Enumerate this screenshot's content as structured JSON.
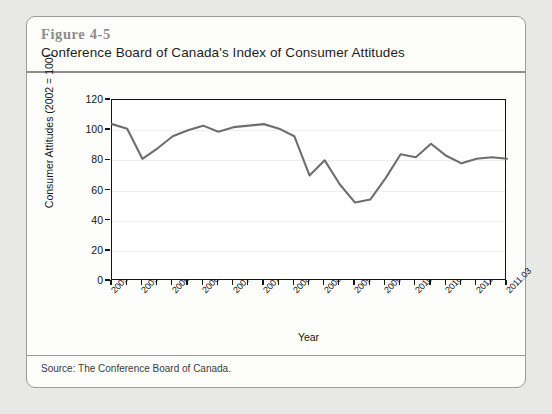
{
  "figure": {
    "number": "Figure 4-5",
    "title": "Conference Board of Canada's Index of Consumer Attitudes",
    "source": "Source: The Conference Board of Canada."
  },
  "chart_data": {
    "type": "line",
    "title": "Conference Board of Canada's Index of Consumer Attitudes",
    "xlabel": "Year",
    "ylabel": "Consumer Attitudes (2002 = 100)",
    "ylim": [
      0,
      120
    ],
    "yticks": [
      0,
      20,
      40,
      60,
      80,
      100,
      120
    ],
    "grid": true,
    "legend": "none",
    "line_color": "#6e6e6e",
    "x_tick_labels": [
      "2005.01",
      "2005.03",
      "2006.01",
      "2006.03",
      "2007.01",
      "2007.03",
      "2008.01",
      "2008.03",
      "2009.01",
      "2009.03",
      "2010.01",
      "2010.03",
      "2011.01",
      "2011.03"
    ],
    "x": [
      "2005.01",
      "2005.02",
      "2005.03",
      "2005.04",
      "2006.01",
      "2006.02",
      "2006.03",
      "2006.04",
      "2007.01",
      "2007.02",
      "2007.03",
      "2007.04",
      "2008.01",
      "2008.02",
      "2008.03",
      "2008.04",
      "2009.01",
      "2009.02",
      "2009.03",
      "2009.04",
      "2010.01",
      "2010.02",
      "2010.03",
      "2010.04",
      "2011.01",
      "2011.02",
      "2011.03"
    ],
    "values": [
      104,
      101,
      81,
      88,
      96,
      100,
      103,
      99,
      102,
      103,
      104,
      101,
      96,
      70,
      80,
      64,
      52,
      54,
      68,
      84,
      82,
      91,
      83,
      78,
      81,
      82,
      81
    ]
  }
}
